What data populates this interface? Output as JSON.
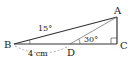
{
  "diagram": {
    "type": "geometry-triangle",
    "points": {
      "A": {
        "label": "A",
        "x": 117,
        "y": 17
      },
      "B": {
        "label": "B",
        "x": 14,
        "y": 44
      },
      "C": {
        "label": "C",
        "x": 117,
        "y": 44
      },
      "D": {
        "label": "D",
        "x": 70,
        "y": 44
      }
    },
    "segments": [
      {
        "from": "B",
        "to": "A"
      },
      {
        "from": "D",
        "to": "A"
      },
      {
        "from": "A",
        "to": "C"
      },
      {
        "from": "B",
        "to": "C"
      }
    ],
    "angles": {
      "B": {
        "label": "15°"
      },
      "D": {
        "label": "30°"
      },
      "C": {
        "label": "right-angle"
      }
    },
    "measures": {
      "BD": {
        "label": "4 cm"
      }
    },
    "colors": {
      "line": "#333333",
      "thin_line": "#777777",
      "text": "#222222"
    }
  }
}
